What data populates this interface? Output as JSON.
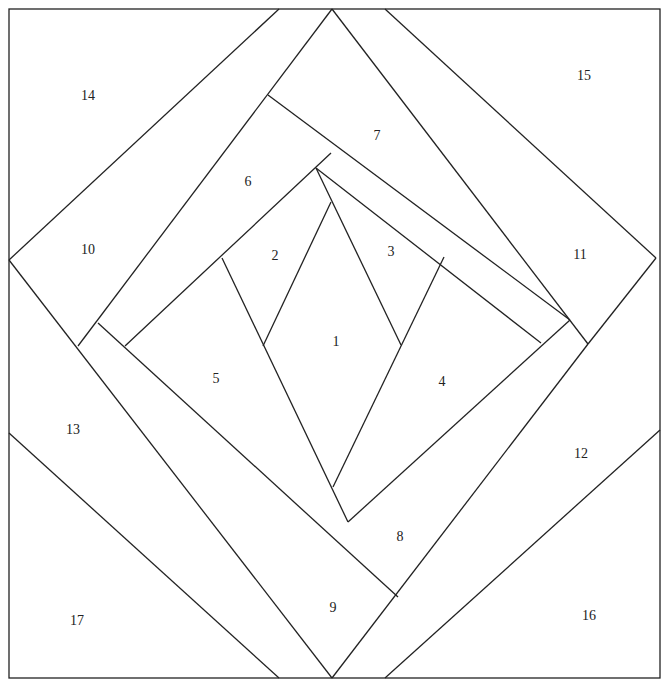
{
  "diagram": {
    "type": "paper-piecing-pattern",
    "stroke_color": "#222222",
    "background": "#ffffff",
    "frame": {
      "x": 9,
      "y": 9,
      "w": 651,
      "h": 669
    },
    "lines": [
      [
        279,
        9,
        9,
        260
      ],
      [
        385,
        9,
        656,
        258
      ],
      [
        9,
        433,
        279,
        678
      ],
      [
        660,
        430,
        385,
        678
      ],
      [
        332,
        9,
        78,
        346
      ],
      [
        332,
        9,
        588,
        344
      ],
      [
        9,
        260,
        332,
        678
      ],
      [
        656,
        258,
        588,
        344
      ],
      [
        588,
        344,
        332,
        678
      ],
      [
        268,
        95,
        570,
        320
      ],
      [
        331,
        153,
        125,
        346
      ],
      [
        316,
        168,
        541,
        343
      ],
      [
        570,
        320,
        348,
        522
      ],
      [
        98,
        323,
        398,
        597
      ],
      [
        222,
        258,
        348,
        522
      ],
      [
        331,
        202,
        263,
        346
      ],
      [
        316,
        168,
        401,
        345
      ],
      [
        444,
        257,
        333,
        487
      ]
    ],
    "pieces": [
      {
        "id": "1",
        "label": "1",
        "x": 336,
        "y": 342
      },
      {
        "id": "2",
        "label": "2",
        "x": 275,
        "y": 256
      },
      {
        "id": "3",
        "label": "3",
        "x": 391,
        "y": 252
      },
      {
        "id": "4",
        "label": "4",
        "x": 442,
        "y": 382
      },
      {
        "id": "5",
        "label": "5",
        "x": 216,
        "y": 379
      },
      {
        "id": "6",
        "label": "6",
        "x": 248,
        "y": 182
      },
      {
        "id": "7",
        "label": "7",
        "x": 377,
        "y": 136
      },
      {
        "id": "8",
        "label": "8",
        "x": 400,
        "y": 537
      },
      {
        "id": "9",
        "label": "9",
        "x": 333,
        "y": 608
      },
      {
        "id": "10",
        "label": "10",
        "x": 88,
        "y": 250
      },
      {
        "id": "11",
        "label": "11",
        "x": 580,
        "y": 255
      },
      {
        "id": "12",
        "label": "12",
        "x": 581,
        "y": 454
      },
      {
        "id": "13",
        "label": "13",
        "x": 73,
        "y": 430
      },
      {
        "id": "14",
        "label": "14",
        "x": 88,
        "y": 96
      },
      {
        "id": "15",
        "label": "15",
        "x": 584,
        "y": 76
      },
      {
        "id": "16",
        "label": "16",
        "x": 589,
        "y": 616
      },
      {
        "id": "17",
        "label": "17",
        "x": 77,
        "y": 621
      }
    ]
  }
}
